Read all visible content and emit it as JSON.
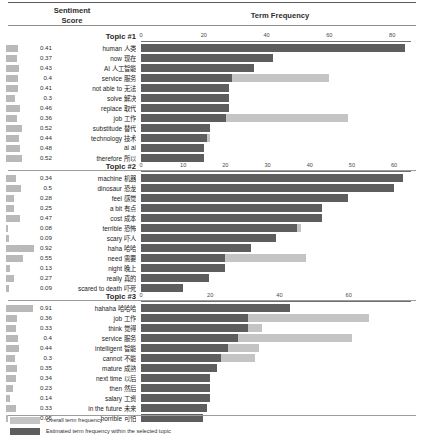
{
  "header": {
    "sentiment_label_line1": "Sentiment",
    "sentiment_label_line2": "Score",
    "term_frequency_label": "Term Frequency"
  },
  "legend": {
    "overall_label": "Overall term frequency",
    "topic_label": "Estimated term frequency within the selected topic",
    "overall_color": "#c4c4c4",
    "topic_color": "#5e5e5e",
    "sentiment_color": "#b9b9b9"
  },
  "chart_data": {
    "type": "bar",
    "title": "Term Frequency",
    "xlabel": "Term Frequency",
    "ylabel": "",
    "orientation": "horizontal",
    "grid": false,
    "legend_position": "bottom-left",
    "series": [
      {
        "name": "Overall term frequency",
        "color": "#c4c4c4"
      },
      {
        "name": "Estimated term frequency within the selected topic",
        "color": "#5e5e5e"
      }
    ],
    "panels": [
      {
        "title": "Topic #1",
        "xlim": [
          0,
          86
        ],
        "xticks": [
          0,
          20,
          40,
          60,
          80
        ],
        "categories": [
          "human 人类",
          "now 现在",
          "AI 人工智能",
          "service 服务",
          "not able to 无法",
          "solve 解决",
          "replace 取代",
          "job 工作",
          "substitude 替代",
          "technology 技术",
          "ai ai",
          "therefore 所以"
        ],
        "terms": [
          {
            "en": "human",
            "cn": "人类",
            "sentiment": 0.41,
            "topic_freq": 84,
            "overall_freq": 84
          },
          {
            "en": "now",
            "cn": "现在",
            "sentiment": 0.37,
            "topic_freq": 42,
            "overall_freq": 42
          },
          {
            "en": "AI",
            "cn": "人工智能",
            "sentiment": 0.43,
            "topic_freq": 36,
            "overall_freq": 36
          },
          {
            "en": "service",
            "cn": "服务",
            "sentiment": 0.4,
            "topic_freq": 29,
            "overall_freq": 60
          },
          {
            "en": "not able to",
            "cn": "无法",
            "sentiment": 0.41,
            "topic_freq": 28,
            "overall_freq": 28
          },
          {
            "en": "solve",
            "cn": "解决",
            "sentiment": 0.3,
            "topic_freq": 28,
            "overall_freq": 28
          },
          {
            "en": "replace",
            "cn": "取代",
            "sentiment": 0.46,
            "topic_freq": 28,
            "overall_freq": 28
          },
          {
            "en": "job",
            "cn": "工作",
            "sentiment": 0.36,
            "topic_freq": 27,
            "overall_freq": 66
          },
          {
            "en": "substitude",
            "cn": "替代",
            "sentiment": 0.52,
            "topic_freq": 22,
            "overall_freq": 22
          },
          {
            "en": "technology",
            "cn": "技术",
            "sentiment": 0.44,
            "topic_freq": 21,
            "overall_freq": 22
          },
          {
            "en": "ai",
            "cn": "ai",
            "sentiment": 0.48,
            "topic_freq": 20,
            "overall_freq": 20
          },
          {
            "en": "therefore",
            "cn": "所以",
            "sentiment": 0.52,
            "topic_freq": 20,
            "overall_freq": 20
          }
        ]
      },
      {
        "title": "Topic #2",
        "xlim": [
          0,
          64
        ],
        "xticks": [
          0,
          10,
          20,
          30,
          40,
          50,
          60
        ],
        "categories": [
          "machine 机器",
          "dinosaur 恐龙",
          "feel 感觉",
          "a bit 有点",
          "cost 成本",
          "terrible 恐怖",
          "scary 吓人",
          "haha 哈哈",
          "need 需要",
          "night 晚上",
          "really 真的",
          "scared to death 吓死"
        ],
        "terms": [
          {
            "en": "machine",
            "cn": "机器",
            "sentiment": 0.34,
            "topic_freq": 62,
            "overall_freq": 62
          },
          {
            "en": "dinosaur",
            "cn": "恐龙",
            "sentiment": 0.5,
            "topic_freq": 60,
            "overall_freq": 60
          },
          {
            "en": "feel",
            "cn": "感觉",
            "sentiment": 0.28,
            "topic_freq": 49,
            "overall_freq": 49
          },
          {
            "en": "a bit",
            "cn": "有点",
            "sentiment": 0.25,
            "topic_freq": 43,
            "overall_freq": 43
          },
          {
            "en": "cost",
            "cn": "成本",
            "sentiment": 0.47,
            "topic_freq": 43,
            "overall_freq": 43
          },
          {
            "en": "terrible",
            "cn": "恐怖",
            "sentiment": 0.08,
            "topic_freq": 37,
            "overall_freq": 38
          },
          {
            "en": "scary",
            "cn": "吓人",
            "sentiment": 0.09,
            "topic_freq": 32,
            "overall_freq": 32
          },
          {
            "en": "haha",
            "cn": "哈哈",
            "sentiment": 0.92,
            "topic_freq": 26,
            "overall_freq": 26
          },
          {
            "en": "need",
            "cn": "需要",
            "sentiment": 0.55,
            "topic_freq": 20,
            "overall_freq": 39
          },
          {
            "en": "night",
            "cn": "晚上",
            "sentiment": 0.13,
            "topic_freq": 20,
            "overall_freq": 20
          },
          {
            "en": "really",
            "cn": "真的",
            "sentiment": 0.27,
            "topic_freq": 16,
            "overall_freq": 16
          },
          {
            "en": "scared to death",
            "cn": "吓死",
            "sentiment": 0.09,
            "topic_freq": 10,
            "overall_freq": 10
          }
        ]
      },
      {
        "title": "Topic #3",
        "xlim": [
          0,
          78
        ],
        "xticks": [
          0,
          20,
          40,
          60
        ],
        "categories": [
          "hahaha 哈哈哈",
          "job 工作",
          "think 觉得",
          "service 服务",
          "intelligent 智能",
          "cannot 不能",
          "mature 成熟",
          "next time 以后",
          "then 然后",
          "salary 工资",
          "in the future 未来",
          "horrible 可怕"
        ],
        "terms": [
          {
            "en": "hahaha",
            "cn": "哈哈哈",
            "sentiment": 0.91,
            "topic_freq": 43,
            "overall_freq": 43
          },
          {
            "en": "job",
            "cn": "工作",
            "sentiment": 0.36,
            "topic_freq": 31,
            "overall_freq": 66
          },
          {
            "en": "think",
            "cn": "觉得",
            "sentiment": 0.33,
            "topic_freq": 31,
            "overall_freq": 35
          },
          {
            "en": "service",
            "cn": "服务",
            "sentiment": 0.4,
            "topic_freq": 28,
            "overall_freq": 61
          },
          {
            "en": "intelligent",
            "cn": "智能",
            "sentiment": 0.44,
            "topic_freq": 25,
            "overall_freq": 34
          },
          {
            "en": "cannot",
            "cn": "不能",
            "sentiment": 0.3,
            "topic_freq": 23,
            "overall_freq": 33
          },
          {
            "en": "mature",
            "cn": "成熟",
            "sentiment": 0.35,
            "topic_freq": 22,
            "overall_freq": 22
          },
          {
            "en": "next time",
            "cn": "以后",
            "sentiment": 0.34,
            "topic_freq": 20,
            "overall_freq": 20
          },
          {
            "en": "then",
            "cn": "然后",
            "sentiment": 0.23,
            "topic_freq": 20,
            "overall_freq": 20
          },
          {
            "en": "salary",
            "cn": "工资",
            "sentiment": 0.14,
            "topic_freq": 20,
            "overall_freq": 20
          },
          {
            "en": "in the future",
            "cn": "未来",
            "sentiment": 0.33,
            "topic_freq": 19,
            "overall_freq": 19
          },
          {
            "en": "horrible",
            "cn": "可怕",
            "sentiment": 0.05,
            "topic_freq": 18,
            "overall_freq": 18
          }
        ]
      }
    ]
  }
}
